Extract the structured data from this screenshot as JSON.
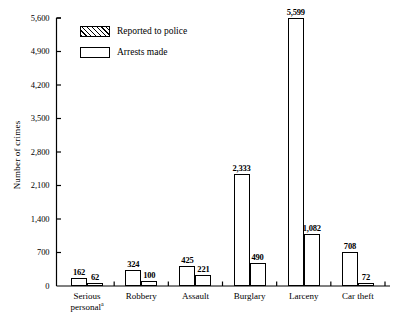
{
  "chart_data": {
    "type": "bar",
    "title": "",
    "subtitle": "",
    "xlabel": "",
    "ylabel": "Number of crimes",
    "ylim": [
      0,
      5600
    ],
    "ytick_values": [
      0,
      700,
      1400,
      2100,
      2800,
      3500,
      4200,
      4900,
      5600
    ],
    "ytick_labels": [
      "0",
      "700",
      "1,400",
      "2,100",
      "2,800",
      "3,500",
      "4,200",
      "4,900",
      "5,600"
    ],
    "grid": false,
    "legend_position": "upper-left-inside",
    "categories": [
      "Serious personal",
      "Robbery",
      "Assault",
      "Burglary",
      "Larceny",
      "Car theft"
    ],
    "category_labels": [
      {
        "line1": "Serious",
        "line2": "personal",
        "superscript": "a"
      },
      {
        "line1": "Robbery",
        "line2": "",
        "superscript": ""
      },
      {
        "line1": "Assault",
        "line2": "",
        "superscript": ""
      },
      {
        "line1": "Burglary",
        "line2": "",
        "superscript": ""
      },
      {
        "line1": "Larceny",
        "line2": "",
        "superscript": ""
      },
      {
        "line1": "Car theft",
        "line2": "",
        "superscript": ""
      }
    ],
    "series": [
      {
        "name": "Reported to police",
        "style": "hatched",
        "values": [
          162,
          324,
          425,
          2333,
          5599,
          708
        ],
        "value_labels": [
          "162",
          "324",
          "425",
          "2,333",
          "5,599",
          "708"
        ]
      },
      {
        "name": "Arrests made",
        "style": "open",
        "values": [
          62,
          100,
          221,
          490,
          1082,
          72
        ],
        "value_labels": [
          "62",
          "100",
          "221",
          "490",
          "1,082",
          "72"
        ]
      }
    ],
    "colors": {
      "axis": "#000000",
      "bar_outline": "#000000",
      "bar_fill_open": "#ffffff",
      "hatch_line": "#000000",
      "background": "#ffffff"
    }
  },
  "legend": {
    "items": [
      {
        "label": "Reported to police",
        "style": "hatched"
      },
      {
        "label": "Arrests made",
        "style": "open"
      }
    ]
  }
}
